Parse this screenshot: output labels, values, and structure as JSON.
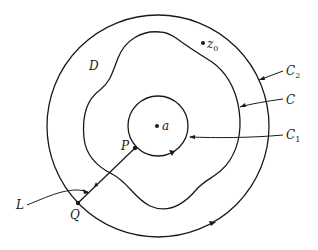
{
  "figure": {
    "stroke_color": "#1a1a1a",
    "background": "#ffffff",
    "labels": {
      "domain": "D",
      "outer_circle": {
        "main": "C",
        "sub": "2"
      },
      "contour": {
        "main": "C",
        "sub": ""
      },
      "inner_circle": {
        "main": "C",
        "sub": "1"
      },
      "center": "a",
      "point_z0": {
        "main": "z",
        "sub": "0"
      },
      "point_p": "P",
      "point_q": "Q",
      "segment": "L"
    },
    "geometry": {
      "outer_circle": {
        "cx": 158,
        "cy": 126,
        "r": 111
      },
      "inner_circle": {
        "cx": 158,
        "cy": 126,
        "r": 30
      },
      "center_a": {
        "x": 157,
        "y": 126
      },
      "z0": {
        "x": 203,
        "y": 43
      },
      "P": {
        "x": 135,
        "y": 148
      },
      "Q": {
        "x": 78,
        "y": 203
      }
    }
  }
}
